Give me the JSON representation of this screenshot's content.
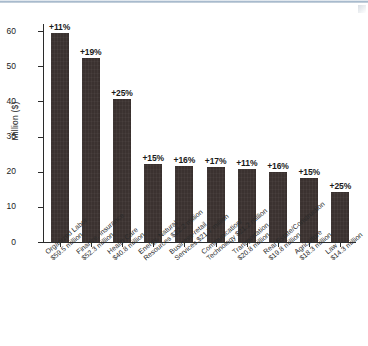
{
  "chart": {
    "type": "bar",
    "title": "",
    "ylabel": "Million ($)",
    "xlabel": "",
    "ylim": [
      0,
      62
    ],
    "ytick_labels": [
      "0",
      "10",
      "20",
      "30",
      "40",
      "50",
      "60"
    ],
    "ytick_values": [
      0,
      10,
      20,
      30,
      40,
      50,
      60
    ],
    "grid": false,
    "legend": null,
    "bar_color": "#3b3230",
    "axis_color": "#2b2b2b"
  },
  "chart_data": {
    "type": "bar",
    "title": "",
    "xlabel": "",
    "ylabel": "Million ($)",
    "ylim": [
      0,
      62
    ],
    "grid": false,
    "legend": null,
    "categories": [
      "Organized Labor $59.5 million",
      "Finance, Insurance $52.3 million",
      "Health Care $40.8 million",
      "Energy, Natural Resources $22.2 million",
      "Business-retail Services $21.7 million",
      "Communication/Technology $21.2 million",
      "Transportation $20.8 million",
      "Real Estate/Construction $19.8 million",
      "Agriculture $18.3 million",
      "Law $14.3 million"
    ],
    "category_lines": [
      [
        "Organized Labor",
        "$59.5 million"
      ],
      [
        "Finance, Insurance",
        "$52.3 million"
      ],
      [
        "Health Care",
        "$40.8 million"
      ],
      [
        "Energy, Natural",
        "Resources $22.2 million"
      ],
      [
        "Business-retail",
        "Services $21.7 million"
      ],
      [
        "Communication/",
        "Technology $21.2 million"
      ],
      [
        "Transportation",
        "$20.8 million"
      ],
      [
        "Real Estate/Construction",
        "$19.8 million"
      ],
      [
        "Agriculture",
        "$18.3 million"
      ],
      [
        "Law",
        "$14.3 million"
      ]
    ],
    "values": [
      59.5,
      52.3,
      40.8,
      22.2,
      21.7,
      21.2,
      20.8,
      19.8,
      18.3,
      14.3
    ],
    "data_labels": [
      "+11%",
      "+19%",
      "+25%",
      "+15%",
      "+16%",
      "+17%",
      "+11%",
      "+16%",
      "+15%",
      "+25%"
    ],
    "value_unit": "Million ($)"
  }
}
